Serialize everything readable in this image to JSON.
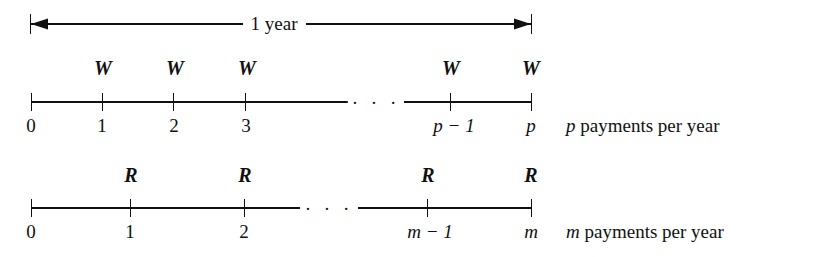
{
  "figure": {
    "type": "payment-timeline-diagram",
    "span_label": "1 year",
    "timelines": [
      {
        "id": "top",
        "payment_symbol": "W",
        "description": "p payments per year",
        "description_symbol": "p",
        "description_rest": " payments per year",
        "ellipsis": "· · ·",
        "ticks": [
          {
            "label": "0",
            "payment": ""
          },
          {
            "label": "1",
            "payment": "W"
          },
          {
            "label": "2",
            "payment": "W"
          },
          {
            "label": "3",
            "payment": "W"
          },
          {
            "label": "p − 1",
            "payment": "W"
          },
          {
            "label": "p",
            "payment": "W"
          }
        ]
      },
      {
        "id": "bottom",
        "payment_symbol": "R",
        "description": "m payments per year",
        "description_symbol": "m",
        "description_rest": " payments per year",
        "ellipsis": "· · ·",
        "ticks": [
          {
            "label": "0",
            "payment": ""
          },
          {
            "label": "1",
            "payment": "R"
          },
          {
            "label": "2",
            "payment": "R"
          },
          {
            "label": "m − 1",
            "payment": "R"
          },
          {
            "label": "m",
            "payment": "R"
          }
        ]
      }
    ],
    "colors": {
      "ink": "#111111",
      "background": "#ffffff"
    }
  }
}
